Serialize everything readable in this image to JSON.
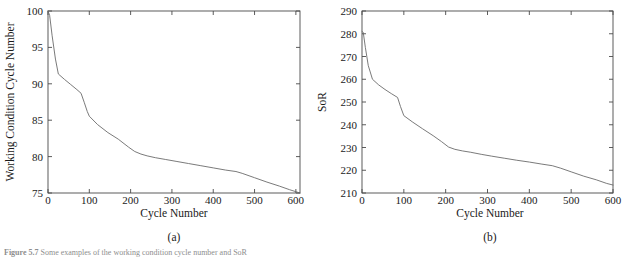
{
  "figure": {
    "panel_a_label": "(a)",
    "panel_b_label": "(b)",
    "caption_prefix": "Figure 5.7",
    "caption_text": "Some examples of the working condition cycle number and SoR"
  },
  "chart_data": [
    {
      "type": "line",
      "id": "panel-a",
      "title": "",
      "panel_label": "(a)",
      "xlabel": "Cycle Number",
      "ylabel": "Working Condition Cycle Number",
      "xlim": [
        0,
        610
      ],
      "ylim": [
        75,
        100
      ],
      "xticks": [
        0,
        100,
        200,
        300,
        400,
        500,
        600
      ],
      "xticklabels": [
        "0",
        "100",
        "200",
        "300",
        "400",
        "500",
        "600"
      ],
      "yticks": [
        75,
        80,
        85,
        90,
        95,
        100
      ],
      "yticklabels": [
        "75",
        "80",
        "85",
        "90",
        "95",
        "100"
      ],
      "grid": false,
      "legend": null,
      "series": [
        {
          "name": "Working Condition Cycle Number",
          "color": "#6b6b6b",
          "x": [
            0,
            4,
            10,
            18,
            25,
            40,
            55,
            70,
            80,
            88,
            95,
            100,
            120,
            145,
            170,
            195,
            210,
            225,
            240,
            260,
            285,
            310,
            340,
            370,
            400,
            430,
            455,
            470,
            500,
            530,
            560,
            585,
            610
          ],
          "y": [
            100.0,
            99.4,
            96.6,
            93.4,
            91.35,
            90.6,
            89.9,
            89.2,
            88.7,
            87.4,
            86.2,
            85.55,
            84.4,
            83.3,
            82.4,
            81.3,
            80.7,
            80.35,
            80.1,
            79.85,
            79.6,
            79.35,
            79.05,
            78.75,
            78.45,
            78.15,
            77.95,
            77.7,
            77.1,
            76.5,
            75.95,
            75.45,
            75.0
          ]
        }
      ]
    },
    {
      "type": "line",
      "id": "panel-b",
      "title": "",
      "panel_label": "(b)",
      "xlabel": "Cycle Number",
      "ylabel": "SoR",
      "xlim": [
        0,
        600
      ],
      "ylim": [
        210,
        290
      ],
      "xticks": [
        0,
        100,
        200,
        300,
        400,
        500,
        600
      ],
      "xticklabels": [
        "0",
        "100",
        "200",
        "300",
        "400",
        "500",
        "600"
      ],
      "yticks": [
        210,
        220,
        230,
        240,
        250,
        260,
        270,
        280,
        290
      ],
      "yticklabels": [
        "210",
        "220",
        "230",
        "240",
        "250",
        "260",
        "270",
        "280",
        "290"
      ],
      "grid": false,
      "legend": null,
      "series": [
        {
          "name": "SoR",
          "color": "#6b6b6b",
          "x": [
            0,
            3,
            8,
            15,
            25,
            40,
            55,
            70,
            85,
            92,
            100,
            120,
            145,
            170,
            190,
            207,
            222,
            240,
            260,
            285,
            310,
            340,
            370,
            400,
            430,
            455,
            475,
            500,
            530,
            560,
            585,
            600
          ],
          "y": [
            281.0,
            280.6,
            274.0,
            266.0,
            260.0,
            257.5,
            255.5,
            253.7,
            252.0,
            248.0,
            244.0,
            241.3,
            238.2,
            235.2,
            232.6,
            230.2,
            229.2,
            228.5,
            227.9,
            227.0,
            226.2,
            225.3,
            224.4,
            223.6,
            222.7,
            222.0,
            220.9,
            219.3,
            217.4,
            215.8,
            214.2,
            213.5
          ]
        }
      ]
    }
  ]
}
